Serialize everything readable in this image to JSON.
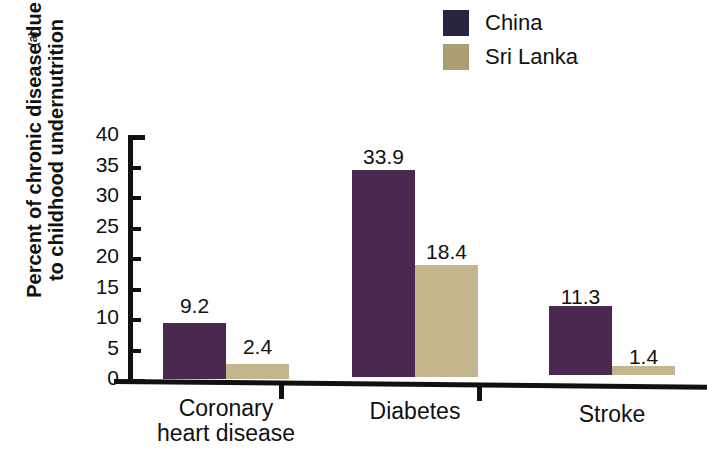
{
  "figure": {
    "panel_letter": "(a)"
  },
  "legend": {
    "position": "top-right",
    "items": [
      {
        "label": "China",
        "color": "#272440"
      },
      {
        "label": "Sri Lanka",
        "color": "#ab9e73"
      }
    ]
  },
  "axes": {
    "y_title_line1": "Percent of chronic disease due",
    "y_title_line2": "to childhood undernutrition",
    "y_ticks": [
      "0",
      "5",
      "10",
      "15",
      "20",
      "25",
      "30",
      "35",
      "40"
    ]
  },
  "categories": [
    {
      "line1": "Coronary",
      "line2": "heart disease"
    },
    {
      "line1": "Diabetes",
      "line2": ""
    },
    {
      "line1": "Stroke",
      "line2": ""
    }
  ],
  "values": {
    "china": [
      "9.2",
      "33.9",
      "11.3"
    ],
    "sri_lanka": [
      "2.4",
      "18.4",
      "1.4"
    ]
  },
  "chart_data": {
    "type": "bar",
    "title": "",
    "subtitle": "",
    "panel": "(a)",
    "xlabel": "",
    "ylabel": "Percent of chronic disease due to childhood undernutrition",
    "categories": [
      "Coronary heart disease",
      "Diabetes",
      "Stroke"
    ],
    "series": [
      {
        "name": "China",
        "values": [
          9.2,
          33.9,
          11.3
        ],
        "color": "#4a2850",
        "legend_color": "#272440"
      },
      {
        "name": "Sri Lanka",
        "values": [
          2.4,
          18.4,
          1.4
        ],
        "color": "#c3b68d",
        "legend_color": "#ab9e73"
      }
    ],
    "ylim": [
      0,
      40
    ],
    "ytick_values": [
      0,
      5,
      10,
      15,
      20,
      25,
      30,
      35,
      40
    ],
    "ytick_labels": [
      "0",
      "5",
      "10",
      "15",
      "20",
      "25",
      "30",
      "35",
      "40"
    ],
    "grid": false,
    "legend_position": "top-right",
    "data_labels": true,
    "data_label_values": [
      "9.2",
      "2.4",
      "33.9",
      "18.4",
      "11.3",
      "1.4"
    ]
  }
}
